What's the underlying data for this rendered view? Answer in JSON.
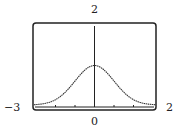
{
  "chart_data": {
    "type": "line",
    "title": "",
    "xlabel": "",
    "ylabel": "",
    "window_labels": {
      "y_max": "2",
      "x_min": "−3",
      "x_max": "2",
      "origin": "0"
    },
    "xlim": [
      -3,
      2
    ],
    "ylim": [
      0,
      2
    ],
    "x_ticks": [
      -2,
      -1,
      0,
      1,
      2
    ],
    "grid": false,
    "legend": null,
    "series": [
      {
        "name": "bell curve",
        "function": "y = e^(-x^2/2)",
        "x": [
          -3.1,
          -2.5,
          -2,
          -1.5,
          -1,
          -0.5,
          0,
          0.5,
          1,
          1.5,
          2,
          2.5,
          3.2
        ],
        "values": [
          0.01,
          0.04,
          0.14,
          0.32,
          0.6,
          0.88,
          1.0,
          0.88,
          0.6,
          0.32,
          0.14,
          0.04,
          0.01
        ]
      }
    ],
    "frame": "rounded rectangle (graphing calculator screen)"
  }
}
